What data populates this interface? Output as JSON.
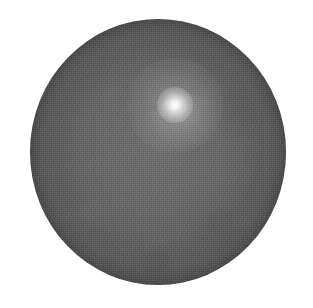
{
  "figure": {
    "background_color": "#ffffff",
    "width_px": 313,
    "height_px": 308,
    "caption": "",
    "labels": [],
    "axis_ticks": [],
    "legend_entries": [],
    "annotations": []
  },
  "disk": {
    "name": "primary-disk",
    "shape": "circle",
    "center_x_px": 158,
    "center_y_px": 152,
    "radius_x_px": 128,
    "radius_y_px": 133,
    "fill_color": "#5f5f5f",
    "edge_color": "#4f5050",
    "texture": "fine-grain-noise"
  },
  "glow": {
    "name": "bright-point-source",
    "center_x_px": 175,
    "center_y_px": 105,
    "core_radius_px": 8,
    "halo_radius_px": 48,
    "peak_color": "#ffffff",
    "description": "diffuse bright spot offset above and right of disk center"
  },
  "chart_data": {
    "type": "heatmap",
    "xlabel": "",
    "ylabel": "",
    "colormap": "grayscale",
    "grid": false,
    "legend_position": "none",
    "xlim": [
      0,
      313
    ],
    "ylim": [
      0,
      308
    ],
    "features": [
      {
        "name": "disk",
        "shape": "circle",
        "cx": 158,
        "cy": 152,
        "rx": 128,
        "ry": 133,
        "mean_intensity": 95,
        "intensity_range": [
          79,
          110
        ]
      },
      {
        "name": "point-source",
        "shape": "gaussian",
        "cx": 175,
        "cy": 105,
        "fwhm_px": 13,
        "peak_intensity": 247,
        "halo_radius_px": 48
      },
      {
        "name": "background",
        "shape": "field",
        "mean_intensity": 255
      }
    ]
  }
}
